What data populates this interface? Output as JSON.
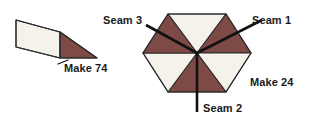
{
  "canvas": {
    "width": 313,
    "height": 119,
    "background": "#ffffff"
  },
  "colors": {
    "light_fabric": "#F4F2EA",
    "dark_fabric": "#7D4A46",
    "outline": "#2B2B2B",
    "seam_line": "#111111",
    "text": "#1A1A1A"
  },
  "labels": {
    "make_74": "Make 74",
    "make_24": "Make 24",
    "seam_1": "Seam 1",
    "seam_2": "Seam 2",
    "seam_3": "Seam 3"
  },
  "left_unit": {
    "name": "half-square-triangle-patch",
    "light_piece_points": "16,20 60,32 60,58 16,47",
    "dark_piece_points": "60,32 97,58 60,58",
    "outline_points": "16,20 60,32 97,58 60,58 16,47",
    "divider_line": {
      "x1": 60,
      "y1": 32,
      "x2": 60,
      "y2": 58
    },
    "quantity": 74
  },
  "right_unit": {
    "name": "hexagon-rosette-six-triangles",
    "center": {
      "x": 197,
      "y": 53
    },
    "triangles": [
      {
        "id": "tri-top-left",
        "fill": "light",
        "points": "197,53 168,14 226,14"
      },
      {
        "id": "tri-top-right",
        "fill": "dark",
        "points": "197,53 226,14 251,53"
      },
      {
        "id": "tri-right",
        "fill": "light",
        "points": "197,53 251,53 226,92"
      },
      {
        "id": "tri-bottom-right",
        "fill": "dark",
        "points": "197,53 226,92 168,92"
      },
      {
        "id": "tri-bottom-left",
        "fill": "light",
        "points": "197,53 168,92 143,53"
      },
      {
        "id": "tri-left",
        "fill": "dark",
        "points": "197,53 143,53 168,14"
      }
    ],
    "hex_outline": "168,14 226,14 251,53 226,92 168,92 143,53",
    "quantity": 24
  },
  "seams": [
    {
      "id": "seam-1",
      "label": "Seam 1",
      "line": {
        "x1": 197,
        "y1": 53,
        "x2": 262,
        "y2": 20
      },
      "label_x": 246,
      "label_y": 24
    },
    {
      "id": "seam-2",
      "label": "Seam 2",
      "line": {
        "x1": 197,
        "y1": 53,
        "x2": 197,
        "y2": 110
      },
      "label_x": 202,
      "label_y": 110
    },
    {
      "id": "seam-3",
      "label": "Seam 3",
      "line": {
        "x1": 197,
        "y1": 53,
        "x2": 146,
        "y2": 25
      },
      "label_x": 103,
      "label_y": 22
    }
  ],
  "leaders": [
    {
      "id": "leader-make-74",
      "x1": 66,
      "y1": 56,
      "x2": 58,
      "y2": 62
    }
  ]
}
